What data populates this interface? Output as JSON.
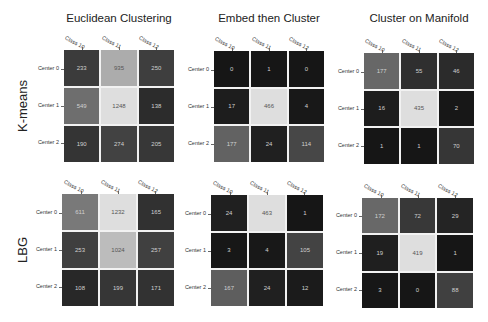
{
  "chart_data": {
    "type": "heatmap",
    "column_titles": [
      "Euclidean Clustering",
      "Embed then Cluster",
      "Cluster on Manifold"
    ],
    "row_titles": [
      "K-means",
      "LBG"
    ],
    "x_tick_labels": [
      "Class 10",
      "Class 11",
      "Class 12"
    ],
    "y_tick_labels": [
      "Center 0",
      "Center 1",
      "Center 2"
    ],
    "colormap": "gray",
    "matrices": [
      {
        "row": "K-means",
        "column": "Euclidean Clustering",
        "values": [
          [
            233,
            935,
            250
          ],
          [
            549,
            1248,
            138
          ],
          [
            190,
            274,
            205
          ]
        ]
      },
      {
        "row": "K-means",
        "column": "Embed then Cluster",
        "values": [
          [
            0,
            1,
            0
          ],
          [
            17,
            466,
            4
          ],
          [
            177,
            24,
            114
          ]
        ]
      },
      {
        "row": "K-means",
        "column": "Cluster on Manifold",
        "values": [
          [
            177,
            55,
            46
          ],
          [
            16,
            435,
            2
          ],
          [
            1,
            1,
            70
          ]
        ]
      },
      {
        "row": "LBG",
        "column": "Euclidean Clustering",
        "values": [
          [
            611,
            1232,
            165
          ],
          [
            253,
            1024,
            257
          ],
          [
            108,
            199,
            171
          ]
        ]
      },
      {
        "row": "LBG",
        "column": "Embed then Cluster",
        "values": [
          [
            24,
            463,
            1
          ],
          [
            3,
            4,
            105
          ],
          [
            167,
            24,
            12
          ]
        ]
      },
      {
        "row": "LBG",
        "column": "Cluster on Manifold",
        "values": [
          [
            172,
            72,
            29
          ],
          [
            19,
            419,
            1
          ],
          [
            3,
            0,
            88
          ]
        ]
      }
    ]
  },
  "layout": {
    "column_title_positions": [
      {
        "x": 119,
        "y": 12
      },
      {
        "x": 269,
        "y": 12
      },
      {
        "x": 419,
        "y": 12
      }
    ],
    "row_title_positions": [
      {
        "x": 22,
        "y": 106
      },
      {
        "x": 22,
        "y": 250
      }
    ],
    "matrix_positions": [
      {
        "x": 64,
        "y": 50,
        "w": 110,
        "h": 112
      },
      {
        "x": 214,
        "y": 51,
        "w": 110,
        "h": 111
      },
      {
        "x": 364,
        "y": 53,
        "w": 110,
        "h": 111
      },
      {
        "x": 62,
        "y": 194,
        "w": 112,
        "h": 112
      },
      {
        "x": 211,
        "y": 195,
        "w": 112,
        "h": 111
      },
      {
        "x": 362,
        "y": 198,
        "w": 111,
        "h": 110
      }
    ]
  }
}
